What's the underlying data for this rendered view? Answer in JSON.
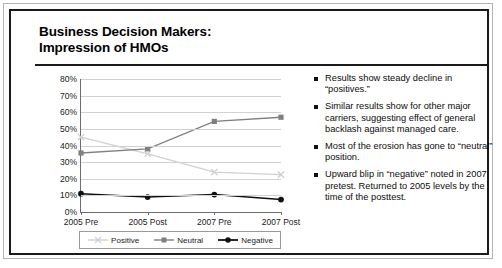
{
  "slide": {
    "title": "Business Decision Makers:\nImpression of HMOs"
  },
  "chart_data": {
    "type": "line",
    "title": "Business Decision Makers: Impression of HMOs",
    "categories": [
      "2005 Pre",
      "2005 Post",
      "2007 Pre",
      "2007 Post"
    ],
    "series": [
      {
        "name": "Positive",
        "values": [
          45,
          35,
          24,
          22.5
        ],
        "color": "#d0d0d0",
        "marker": "x"
      },
      {
        "name": "Neutral",
        "values": [
          35.5,
          38,
          54.5,
          57
        ],
        "color": "#808080",
        "marker": "square"
      },
      {
        "name": "Negative",
        "values": [
          11,
          9,
          10.5,
          7.5
        ],
        "color": "#111111",
        "marker": "circle"
      }
    ],
    "ylim": [
      0,
      80
    ],
    "ytick_step": 10,
    "ytick_labels": [
      "0%",
      "10%",
      "20%",
      "30%",
      "40%",
      "50%",
      "60%",
      "70%",
      "80%"
    ],
    "xlabel": "",
    "ylabel": "",
    "grid": true,
    "legend_position": "bottom"
  },
  "bullets": [
    "Results show steady decline in “positives.”",
    "Similar results show for other major carriers, suggesting effect of general backlash against managed care.",
    "Most of the erosion has gone to “neutral” position.",
    "Upward blip in “negative” noted in 2007 pretest. Returned to 2005 levels by the time of the posttest."
  ]
}
